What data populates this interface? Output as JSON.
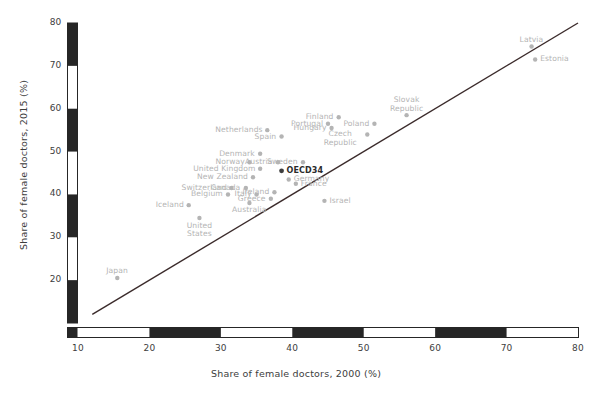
{
  "chart_data": {
    "type": "scatter",
    "title": "",
    "xlabel": "Share of female doctors, 2000 (%)",
    "ylabel": "Share of female doctors, 2015 (%)",
    "xlim": [
      10,
      80
    ],
    "ylim": [
      10,
      80
    ],
    "xticks": [
      10,
      20,
      30,
      40,
      50,
      60,
      70,
      80
    ],
    "yticks": [
      20,
      30,
      40,
      50,
      60,
      70,
      80
    ],
    "grid": false,
    "legend": "none",
    "reference_line": {
      "name": "45-degree-parity-line",
      "from": [
        12,
        12
      ],
      "to": [
        80,
        80
      ],
      "color": "#3b2b2b"
    },
    "marker_color": "#b4b4b4",
    "highlight_marker_color": "#3d3d3d",
    "points": [
      {
        "label": "Latvia",
        "x": 73.5,
        "y": 74.5,
        "pos": "above"
      },
      {
        "label": "Estonia",
        "x": 74.0,
        "y": 71.5,
        "pos": "right"
      },
      {
        "label": "Slovak Republic",
        "x": 56.0,
        "y": 58.5,
        "pos": "above-2"
      },
      {
        "label": "Poland",
        "x": 51.5,
        "y": 56.5,
        "pos": "left"
      },
      {
        "label": "Hungary",
        "x": 45.5,
        "y": 55.5,
        "pos": "left"
      },
      {
        "label": "Finland",
        "x": 46.5,
        "y": 58.0,
        "pos": "left"
      },
      {
        "label": "Czech Republic",
        "x": 50.5,
        "y": 54.0,
        "pos": "left-2"
      },
      {
        "label": "Portugal",
        "x": 45.0,
        "y": 56.5,
        "pos": "left"
      },
      {
        "label": "Netherlands",
        "x": 36.5,
        "y": 55.0,
        "pos": "left"
      },
      {
        "label": "Spain",
        "x": 38.5,
        "y": 53.5,
        "pos": "left"
      },
      {
        "label": "Denmark",
        "x": 35.5,
        "y": 49.5,
        "pos": "left"
      },
      {
        "label": "Norway",
        "x": 34.0,
        "y": 47.5,
        "pos": "left"
      },
      {
        "label": "Austria",
        "x": 38.0,
        "y": 47.5,
        "pos": "left"
      },
      {
        "label": "Sweden",
        "x": 41.5,
        "y": 47.5,
        "pos": "left"
      },
      {
        "label": "United Kingdom",
        "x": 35.5,
        "y": 46.0,
        "pos": "left"
      },
      {
        "label": "OECD34",
        "x": 38.5,
        "y": 45.5,
        "pos": "right",
        "highlight": true
      },
      {
        "label": "New Zealand",
        "x": 34.5,
        "y": 44.0,
        "pos": "left"
      },
      {
        "label": "Germany",
        "x": 39.5,
        "y": 43.5,
        "pos": "right"
      },
      {
        "label": "France",
        "x": 40.5,
        "y": 42.5,
        "pos": "right"
      },
      {
        "label": "Switzerland",
        "x": 31.5,
        "y": 41.5,
        "pos": "left"
      },
      {
        "label": "Canada",
        "x": 33.5,
        "y": 41.5,
        "pos": "left"
      },
      {
        "label": "Belgium",
        "x": 31.0,
        "y": 40.0,
        "pos": "left"
      },
      {
        "label": "Italy",
        "x": 35.0,
        "y": 40.0,
        "pos": "left"
      },
      {
        "label": "Ireland",
        "x": 37.5,
        "y": 40.5,
        "pos": "left"
      },
      {
        "label": "Greece",
        "x": 37.0,
        "y": 39.0,
        "pos": "left"
      },
      {
        "label": "Australia",
        "x": 34.0,
        "y": 38.0,
        "pos": "below"
      },
      {
        "label": "Israel",
        "x": 44.5,
        "y": 38.5,
        "pos": "right"
      },
      {
        "label": "Iceland",
        "x": 25.5,
        "y": 37.5,
        "pos": "left"
      },
      {
        "label": "United States",
        "x": 27.0,
        "y": 34.5,
        "pos": "below-2"
      },
      {
        "label": "Japan",
        "x": 15.5,
        "y": 20.5,
        "pos": "above"
      }
    ]
  },
  "axis": {
    "y_title": "Share of female doctors, 2015 (%)",
    "x_title": "Share of female doctors, 2000 (%)",
    "y_tick_labels": [
      "80",
      "70",
      "60",
      "50",
      "40",
      "30",
      "20"
    ],
    "x_tick_labels": [
      "10",
      "20",
      "30",
      "40",
      "50",
      "60",
      "70",
      "80"
    ],
    "style": "checkerboard-bar",
    "bar_dark_color": "#262626",
    "bar_light_color": "#ffffff"
  }
}
